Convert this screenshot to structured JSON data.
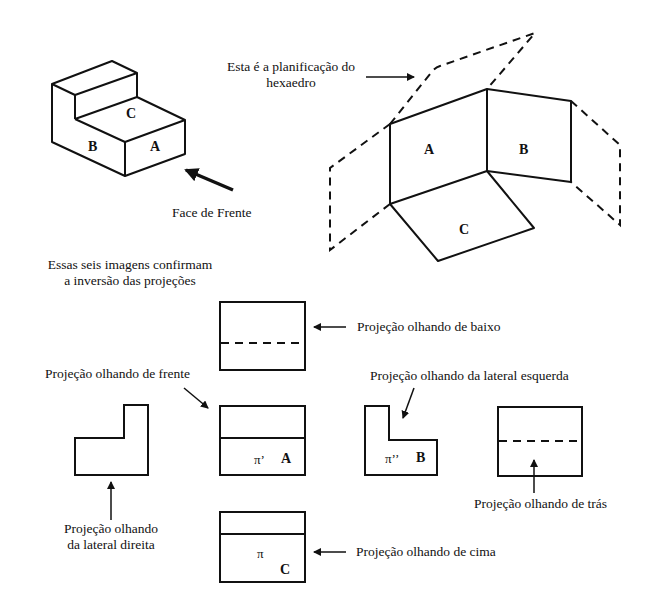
{
  "isometric_view": {
    "faces": {
      "top": "C",
      "left": "B",
      "front": "A"
    },
    "front_label": "Face de Frente"
  },
  "planification": {
    "caption_line1": "Esta é a planificação do",
    "caption_line2": "hexaedro",
    "faces": {
      "left": "A",
      "right": "B",
      "bottom": "C"
    }
  },
  "summary": {
    "line1": "Essas seis imagens confirmam",
    "line2": "a inversão das projeções"
  },
  "projections": {
    "bottom": {
      "label": "Projeção olhando de baixo"
    },
    "front": {
      "label": "Projeção olhando de frente",
      "plane": "π’",
      "face": "A"
    },
    "left": {
      "label": "Projeção olhando da lateral esquerda",
      "plane": "π’’",
      "face": "B"
    },
    "right": {
      "label_line1": "Projeção olhando",
      "label_line2": "da lateral direita"
    },
    "back": {
      "label": "Projeção olhando de trás"
    },
    "top": {
      "label": "Projeção olhando de cima",
      "plane": "π",
      "face": "C"
    }
  }
}
